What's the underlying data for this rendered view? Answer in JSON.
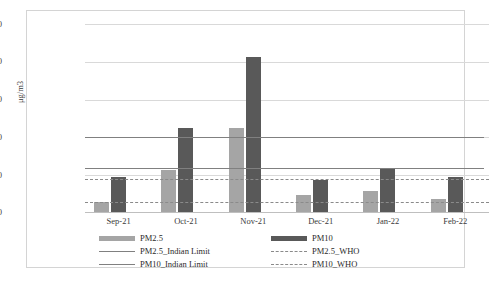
{
  "chart_data": {
    "type": "bar",
    "title": "",
    "xlabel": "",
    "ylabel": "μg/m3",
    "ylim": [
      0,
      250
    ],
    "yticks": [
      0,
      50,
      100,
      150,
      200,
      250
    ],
    "grid": true,
    "legend_position": "bottom",
    "categories": [
      "Sep-21",
      "Oct-21",
      "Nov-21",
      "Dec-21",
      "Jan-22",
      "Feb-22"
    ],
    "series": [
      {
        "name": "PM2.5",
        "color": "#a5a5a5",
        "values": [
          15,
          57,
          113,
          24,
          29,
          19
        ]
      },
      {
        "name": "PM10",
        "color": "#595959",
        "values": [
          47,
          113,
          207,
          44,
          58,
          47
        ]
      }
    ],
    "reference_lines": [
      {
        "name": "PM2.5_Indian Limit",
        "value": 60,
        "style": "solid",
        "color": "#808080"
      },
      {
        "name": "PM10_Indian Limit",
        "value": 100,
        "style": "solid",
        "color": "#808080"
      },
      {
        "name": "PM2.5_WHO",
        "value": 15,
        "style": "dashed",
        "color": "#8a8a8a"
      },
      {
        "name": "PM10_WHO",
        "value": 45,
        "style": "dashed",
        "color": "#8a8a8a"
      }
    ]
  },
  "axis": {
    "y_tick_250": "250",
    "y_tick_200": "200",
    "y_tick_150": "150",
    "y_tick_100": "100",
    "y_tick_50": "50",
    "y_tick_0": "0",
    "y_title": "μg/m3",
    "x_tick_0": "Sep-21",
    "x_tick_1": "Oct-21",
    "x_tick_2": "Nov-21",
    "x_tick_3": "Dec-21",
    "x_tick_4": "Jan-22",
    "x_tick_5": "Feb-22"
  },
  "legend": {
    "items": [
      {
        "label": "PM2.5",
        "key": "swatch-light"
      },
      {
        "label": "PM10",
        "key": "swatch-dark"
      },
      {
        "label": "PM2.5_Indian Limit",
        "key": "line-solid"
      },
      {
        "label": "PM2.5_WHO",
        "key": "line-dashed"
      },
      {
        "label": "PM10_Indian Limit",
        "key": "line-solid"
      },
      {
        "label": "PM10_WHO",
        "key": "line-dashed"
      }
    ]
  }
}
